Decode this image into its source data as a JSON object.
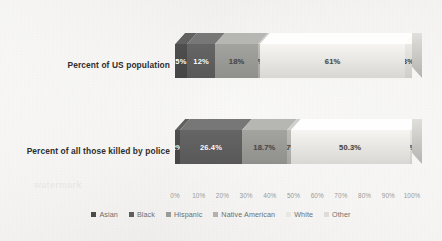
{
  "chart_data": {
    "type": "bar",
    "orientation": "horizontal",
    "stacked": true,
    "normalized_percent": true,
    "three_d": true,
    "title": "",
    "subtitle": "",
    "xlabel": "",
    "ylabel": "",
    "xlim": [
      0,
      100
    ],
    "grid": false,
    "legend_position": "bottom",
    "categories": [
      "Percent of US population",
      "Percent of all those killed by police"
    ],
    "series": [
      {
        "name": "Asian",
        "color": "#4a4a4a",
        "values": [
          5,
          2
        ],
        "labels": [
          "5%",
          "2%"
        ]
      },
      {
        "name": "Black",
        "color": "#5f5f5f",
        "values": [
          12,
          26.4
        ],
        "labels": [
          "12%",
          "26.4%"
        ]
      },
      {
        "name": "Hispanic",
        "color": "#9a9a97",
        "values": [
          18,
          18.7
        ],
        "labels": [
          "18%",
          "18.7%"
        ]
      },
      {
        "name": "Native American",
        "color": "#b3b2ae",
        "values": [
          1,
          1.7
        ],
        "labels": [
          "1%",
          "1.7%"
        ]
      },
      {
        "name": "White",
        "color": "#e8e7e3",
        "values": [
          61,
          50.3
        ],
        "labels": [
          "61%",
          "50.3%"
        ]
      },
      {
        "name": "Other",
        "color": "#dedcd8",
        "values": [
          3,
          1
        ],
        "labels": [
          "3%",
          "1%"
        ]
      }
    ],
    "xticks": [
      "0%",
      "10%",
      "20%",
      "30%",
      "40%",
      "50%",
      "60%",
      "70%",
      "80%",
      "90%",
      "100%"
    ]
  },
  "watermark": {
    "text": "watermark"
  }
}
